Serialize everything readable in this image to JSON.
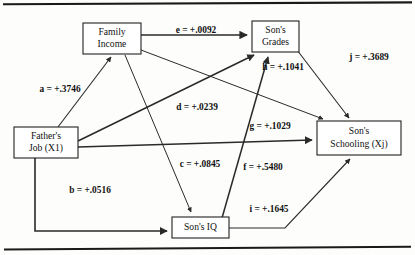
{
  "diagram": {
    "type": "path-diagram",
    "title": "",
    "frame": {
      "top_rule": true,
      "bottom_rule": true,
      "rule_color": "#1a1a1a"
    },
    "nodes": [
      {
        "id": "family_income",
        "name": "family-income",
        "lines": [
          "Family",
          "Income"
        ],
        "line1": "Family",
        "line2": "Income",
        "x": 83,
        "y": 23,
        "w": 58,
        "h": 31
      },
      {
        "id": "sons_grades",
        "name": "sons-grades",
        "lines": [
          "Son's",
          "Grades"
        ],
        "line1": "Son's",
        "line2": "Grades",
        "x": 252,
        "y": 21,
        "w": 47,
        "h": 31
      },
      {
        "id": "fathers_job",
        "name": "fathers-job",
        "lines": [
          "Father's",
          "Job (X1)"
        ],
        "line1": "Father's",
        "line2": "Job (X1)",
        "x": 14,
        "y": 127,
        "w": 64,
        "h": 31
      },
      {
        "id": "sons_schooling",
        "name": "sons-schooling",
        "lines": [
          "Son's",
          "Schooling (Xj)"
        ],
        "line1": "Son's",
        "line2": "Schooling (Xj)",
        "x": 317,
        "y": 121,
        "w": 84,
        "h": 34
      },
      {
        "id": "sons_iq",
        "name": "sons-iq",
        "lines": [
          "Son's IQ"
        ],
        "line1": "Son's IQ",
        "line2": "",
        "x": 172,
        "y": 217,
        "w": 57,
        "h": 21
      }
    ],
    "edges": [
      {
        "id": "a",
        "name": "path-a-fathers-job-to-family-income",
        "label": "a = +.3746",
        "coefficient": "+.3746",
        "from": "fathers_job",
        "to": "family_income",
        "label_x": 60,
        "label_y": 90
      },
      {
        "id": "b",
        "name": "path-b-fathers-job-to-sons-iq",
        "label": "b = +.0516",
        "coefficient": "+.0516",
        "from": "fathers_job",
        "to": "sons_iq",
        "label_x": 90,
        "label_y": 191
      },
      {
        "id": "c",
        "name": "path-c-family-income-to-sons-iq",
        "label": "c = +.0845",
        "coefficient": "+.0845",
        "from": "family_income",
        "to": "sons_iq",
        "label_x": 200,
        "label_y": 165
      },
      {
        "id": "d",
        "name": "path-d-family-income-to-sons-schooling",
        "label": "d = +.0239",
        "coefficient": "+.0239",
        "from": "family_income",
        "to": "sons_schooling",
        "label_x": 197,
        "label_y": 108
      },
      {
        "id": "e",
        "name": "path-e-family-income-to-sons-grades",
        "label": "e = +.0092",
        "coefficient": "+.0092",
        "from": "family_income",
        "to": "sons_grades",
        "label_x": 196,
        "label_y": 31
      },
      {
        "id": "f",
        "name": "path-f-sons-iq-to-sons-grades",
        "label": "f = +.5480",
        "coefficient": "+.5480",
        "from": "sons_iq",
        "to": "sons_grades",
        "label_x": 263,
        "label_y": 168
      },
      {
        "id": "g",
        "name": "path-g-fathers-job-to-sons-schooling",
        "label": "g = +.1029",
        "coefficient": "+.1029",
        "from": "fathers_job",
        "to": "sons_schooling",
        "label_x": 270,
        "label_y": 127
      },
      {
        "id": "h",
        "name": "path-h-fathers-job-to-sons-grades",
        "label": "h = +.1041",
        "coefficient": "+.1041",
        "from": "fathers_job",
        "to": "sons_grades",
        "label_x": 283,
        "label_y": 68
      },
      {
        "id": "i",
        "name": "path-i-sons-iq-to-sons-schooling",
        "label": "i = +.1645",
        "coefficient": "+.1645",
        "from": "sons_iq",
        "to": "sons_schooling",
        "label_x": 269,
        "label_y": 210
      },
      {
        "id": "j",
        "name": "path-j-sons-grades-to-sons-schooling",
        "label": "j = +.3689",
        "coefficient": "+.3689",
        "from": "sons_grades",
        "to": "sons_schooling",
        "label_x": 369,
        "label_y": 58
      }
    ]
  }
}
